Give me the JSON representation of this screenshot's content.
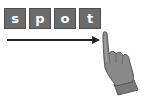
{
  "letters": [
    "s",
    "p",
    "o",
    "t"
  ],
  "word": "spot",
  "tile_color": "#6b6b6b",
  "arrow": {
    "direction": "right",
    "color": "#222222"
  },
  "icon": "pointing-hand-icon"
}
